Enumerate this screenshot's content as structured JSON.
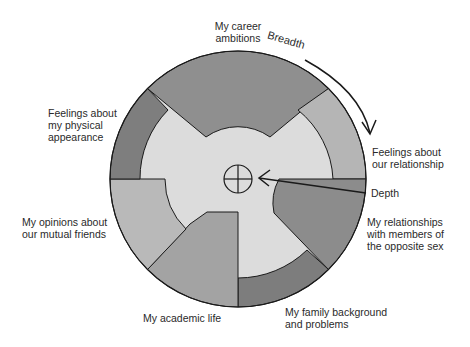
{
  "diagram": {
    "center_symbol": "crosshair-circle",
    "axes": {
      "breadth_label": "Breadth",
      "depth_label": "Depth"
    },
    "topics": [
      {
        "id": "career",
        "label_line1": "My career",
        "label_line2": "ambitions",
        "depth": "deep",
        "color": "#8f8f8f"
      },
      {
        "id": "relationship",
        "label_line1": "Feelings about",
        "label_line2": "our relationship",
        "depth": "shallow",
        "color": "#b5b5b5"
      },
      {
        "id": "opposite-sex",
        "label_line1": "My relationships",
        "label_line2": "with members of",
        "label_line3": "the opposite sex",
        "depth": "deep",
        "color": "#8c8c8c"
      },
      {
        "id": "family",
        "label_line1": "My family background",
        "label_line2": "and problems",
        "depth": "shallow",
        "color": "#7d7d7d"
      },
      {
        "id": "academic",
        "label_line1": "My academic life",
        "depth": "deep",
        "color": "#a3a3a3"
      },
      {
        "id": "friends",
        "label_line1": "My opinions about",
        "label_line2": "our mutual friends",
        "depth": "medium",
        "color": "#b9b9b9"
      },
      {
        "id": "appearance",
        "label_line1": "Feelings about",
        "label_line2": "my physical",
        "label_line3": "appearance",
        "depth": "shallow",
        "color": "#7e7e7e"
      }
    ],
    "colors": {
      "inner_fill": "#dcdcdc",
      "outline": "#1a1a1a",
      "background": "#ffffff"
    }
  }
}
